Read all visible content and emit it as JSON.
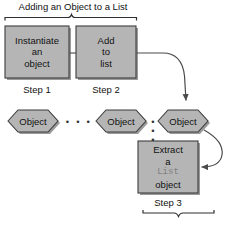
{
  "diagram": {
    "title": "Adding an Object to a List",
    "colors": {
      "shape_fill": "#b5b5b5",
      "shape_stroke": "#3d3d3d",
      "shadow": "#9a9a9a",
      "background": "#ffffff",
      "text": "#111111",
      "mono_text": "#808080",
      "arrow": "#4a4a4a"
    },
    "boxes": [
      {
        "id": "instantiate-object",
        "lines": [
          "Instantiate",
          "an",
          "object"
        ],
        "step": "Step 1"
      },
      {
        "id": "add-to-list",
        "lines": [
          "Add",
          "to",
          "list"
        ],
        "step": "Step 2"
      },
      {
        "id": "extract-list-object",
        "lines": [
          "Extract",
          "a",
          "List",
          "object"
        ],
        "mono_line": "List",
        "step": "Step 3"
      }
    ],
    "hexagons": [
      {
        "id": "object-first",
        "label": "Object"
      },
      {
        "id": "object-middle",
        "label": "Object"
      },
      {
        "id": "object-last",
        "label": "Object"
      }
    ],
    "ellipses": [
      "• • •",
      "• • •"
    ],
    "braces": [
      {
        "id": "top-brace",
        "spans": "Step 1 and Step 2",
        "orientation": "up"
      },
      {
        "id": "bottom-brace",
        "spans": "Step 3",
        "orientation": "down"
      }
    ],
    "arrows": [
      {
        "id": "addlist-to-object",
        "from": "add-to-list",
        "to": "object-last"
      },
      {
        "id": "object-to-extract",
        "from": "object-last",
        "to": "extract-list-object"
      },
      {
        "id": "box1-to-box2-connector",
        "from": "instantiate-object",
        "to": "add-to-list"
      }
    ]
  }
}
